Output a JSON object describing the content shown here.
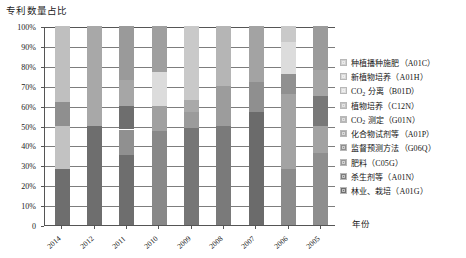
{
  "chart": {
    "title": "专利数量占比",
    "xlabel": "年份",
    "ylabel": ""
  },
  "y_axis": {
    "ticks": [
      "100%",
      "90%",
      "80%",
      "70%",
      "60%",
      "50%",
      "40%",
      "30%",
      "20%",
      "10%",
      "0"
    ]
  },
  "legend": {
    "items": [
      {
        "label": "种植播种施肥（A01C）",
        "color": "#d0d0d0"
      },
      {
        "label": "新植物培养（A01H）",
        "color": "#d9d9d9"
      },
      {
        "label": "CO₂ 分离（B01D）",
        "color": "#dedede"
      },
      {
        "label": "植物培养（C12N）",
        "color": "#c4c4c4"
      },
      {
        "label": "CO₂ 测定（G01N）",
        "color": "#b7b7b7"
      },
      {
        "label": "化合物试剂等（A01P）",
        "color": "#aaaaaa"
      },
      {
        "label": "监督预测方法（G06Q）",
        "color": "#8f8f8f"
      },
      {
        "label": "肥料（C05G）",
        "color": "#999999"
      },
      {
        "label": "杀生剂等（A01N）",
        "color": "#7d7d7d"
      },
      {
        "label": "林业、栽培（A01G）",
        "color": "#6e6e6e"
      }
    ]
  },
  "chart_data": {
    "type": "bar",
    "subtype": "stacked-100-percent",
    "title": "专利数量占比",
    "xlabel": "年份",
    "ylabel": "",
    "ylim": [
      0,
      100
    ],
    "ytick_labels": [
      "0",
      "10%",
      "20%",
      "30%",
      "40%",
      "50%",
      "60%",
      "70%",
      "80%",
      "90%",
      "100%"
    ],
    "grid": true,
    "legend_position": "right",
    "categories": [
      "2014",
      "2012",
      "2011",
      "2010",
      "2009",
      "2008",
      "2007",
      "2006",
      "2005"
    ],
    "series": [
      {
        "name": "种植播种施肥（A01C）",
        "color": "#d0d0d0",
        "values": [
          0,
          0,
          0,
          0,
          0,
          0,
          0,
          0,
          0
        ]
      },
      {
        "name": "新植物培养（A01H）",
        "color": "#d9d9d9",
        "values": [
          0,
          0,
          0,
          0,
          0,
          0,
          0,
          0,
          0
        ]
      },
      {
        "name": "CO₂ 分离（B01D）",
        "color": "#dedede",
        "values": [
          0,
          0,
          0,
          0,
          0,
          0,
          0,
          8,
          0
        ]
      },
      {
        "name": "植物培养（C12N）",
        "color": "#c4c4c4",
        "values": [
          0,
          0,
          0,
          0,
          0,
          0,
          0,
          0,
          0
        ]
      },
      {
        "name": "CO₂ 测定（G01N）",
        "color": "#b7b7b7",
        "values": [
          38,
          50,
          27,
          23,
          29,
          30,
          38,
          0,
          20
        ]
      },
      {
        "name": "化合物试剂等（A01P）",
        "color": "#aaaaaa",
        "values": [
          0,
          0,
          13,
          17,
          0,
          0,
          0,
          26,
          0
        ]
      },
      {
        "name": "监督预测方法（G06Q）",
        "color": "#8f8f8f",
        "values": [
          12,
          0,
          0,
          0,
          8,
          0,
          0,
          0,
          10
        ]
      },
      {
        "name": "肥料（C05G）",
        "color": "#999999",
        "values": [
          22,
          0,
          8,
          0,
          14,
          20,
          0,
          0,
          20
        ]
      },
      {
        "name": "杀生剂等（A01N）",
        "color": "#7d7d7d",
        "values": [
          0,
          0,
          0,
          0,
          0,
          0,
          20,
          0,
          0
        ]
      },
      {
        "name": "林业、栽培（A01G）",
        "color": "#6e6e6e",
        "values": [
          28,
          50,
          52,
          60,
          49,
          50,
          42,
          66,
          50
        ]
      }
    ],
    "stacks": [
      {
        "category": "2014",
        "segments": [
          {
            "name": "林业、栽培（A01G）",
            "from": 0,
            "to": 28,
            "color": "#6e6e6e"
          },
          {
            "name": "肥料（C05G）",
            "from": 28,
            "to": 50,
            "color": "#c2c2c2"
          },
          {
            "name": "监督预测方法（G06Q）",
            "from": 50,
            "to": 62,
            "color": "#8f8f8f"
          },
          {
            "name": "CO₂ 测定（G01N）",
            "from": 62,
            "to": 100,
            "color": "#bfbfbf"
          }
        ]
      },
      {
        "category": "2012",
        "segments": [
          {
            "name": "林业、栽培（A01G）",
            "from": 0,
            "to": 50,
            "color": "#6e6e6e"
          },
          {
            "name": "CO₂ 测定（G01N）",
            "from": 50,
            "to": 100,
            "color": "#a8a8a8"
          }
        ]
      },
      {
        "category": "2011",
        "segments": [
          {
            "name": "林业、栽培（A01G）",
            "from": 0,
            "to": 35,
            "color": "#6e6e6e"
          },
          {
            "name": "肥料（C05G）",
            "from": 35,
            "to": 48,
            "color": "#909090"
          },
          {
            "name": "化合物试剂等（A01P）",
            "from": 48,
            "to": 60,
            "color": "#6e6e6e"
          },
          {
            "name": "CO₂ 测定（G01N）",
            "from": 60,
            "to": 73,
            "color": "#a6a6a6"
          },
          {
            "name": "新植物培养（A01H）",
            "from": 73,
            "to": 100,
            "color": "#9a9a9a"
          }
        ]
      },
      {
        "category": "2010",
        "segments": [
          {
            "name": "林业、栽培（A01G）",
            "from": 0,
            "to": 47,
            "color": "#888888"
          },
          {
            "name": "化合物试剂等（A01P）",
            "from": 47,
            "to": 60,
            "color": "#a0a0a0"
          },
          {
            "name": "CO₂ 分离（B01D）",
            "from": 60,
            "to": 77,
            "color": "#dcdcdc"
          },
          {
            "name": "CO₂ 测定（G01N）",
            "from": 77,
            "to": 100,
            "color": "#9f9f9f"
          }
        ]
      },
      {
        "category": "2009",
        "segments": [
          {
            "name": "林业、栽培（A01G）",
            "from": 0,
            "to": 49,
            "color": "#767676"
          },
          {
            "name": "肥料（C05G）",
            "from": 49,
            "to": 57,
            "color": "#9b9b9b"
          },
          {
            "name": "监督预测方法（G06Q）",
            "from": 57,
            "to": 63,
            "color": "#a9a9a9"
          },
          {
            "name": "CO₂ 测定（G01N）",
            "from": 63,
            "to": 100,
            "color": "#c9c9c9"
          }
        ]
      },
      {
        "category": "2008",
        "segments": [
          {
            "name": "林业、栽培（A01G）",
            "from": 0,
            "to": 50,
            "color": "#7a7a7a"
          },
          {
            "name": "肥料（C05G）",
            "from": 50,
            "to": 70,
            "color": "#9c9c9c"
          },
          {
            "name": "CO₂ 测定（G01N）",
            "from": 70,
            "to": 100,
            "color": "#b5b5b5"
          }
        ]
      },
      {
        "category": "2007",
        "segments": [
          {
            "name": "林业、栽培（A01G）",
            "from": 0,
            "to": 57,
            "color": "#6b6b6b"
          },
          {
            "name": "杀生剂等（A01N）",
            "from": 57,
            "to": 72,
            "color": "#8f8f8f"
          },
          {
            "name": "CO₂ 测定（G01N）",
            "from": 72,
            "to": 100,
            "color": "#a3a3a3"
          }
        ]
      },
      {
        "category": "2006",
        "segments": [
          {
            "name": "林业、栽培（A01G）",
            "from": 0,
            "to": 28,
            "color": "#8b8b8b"
          },
          {
            "name": "化合物试剂等（A01P）",
            "from": 28,
            "to": 66,
            "color": "#a3a3a3"
          },
          {
            "name": "肥料（C05G）",
            "from": 66,
            "to": 76,
            "color": "#909090"
          },
          {
            "name": "CO₂ 分离（B01D）",
            "from": 76,
            "to": 92,
            "color": "#dcdcdc"
          },
          {
            "name": "新植物培养（A01H）",
            "from": 92,
            "to": 100,
            "color": "#c9c9c9"
          }
        ]
      },
      {
        "category": "2005",
        "segments": [
          {
            "name": "林业、栽培（A01G）",
            "from": 0,
            "to": 36,
            "color": "#8e8e8e"
          },
          {
            "name": "肥料（C05G）",
            "from": 36,
            "to": 50,
            "color": "#a2a2a2"
          },
          {
            "name": "监督预测方法（G06Q）",
            "from": 50,
            "to": 65,
            "color": "#787878"
          },
          {
            "name": "CO₂ 测定（G01N）",
            "from": 65,
            "to": 78,
            "color": "#a5a5a5"
          },
          {
            "name": "种植播种施肥（A01C）",
            "from": 78,
            "to": 100,
            "color": "#9b9b9b"
          }
        ]
      }
    ]
  }
}
